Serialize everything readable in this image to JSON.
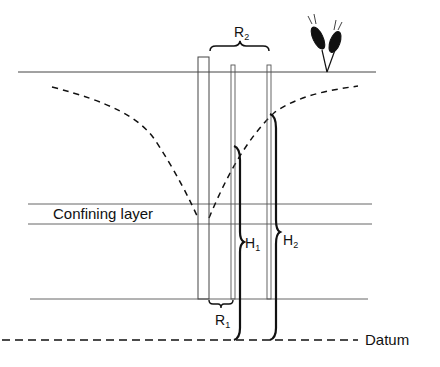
{
  "diagram": {
    "labels": {
      "confining_layer": "Confining layer",
      "datum": "Datum",
      "r1_main": "R",
      "r1_sub": "1",
      "r2_main": "R",
      "r2_sub": "2",
      "h1_main": "H",
      "h1_sub": "1",
      "h2_main": "H",
      "h2_sub": "2"
    },
    "icons": {
      "crop": "wheat-plant-icon"
    },
    "colors": {
      "line": "#333333",
      "ink": "#111111",
      "background": "#ffffff"
    }
  }
}
